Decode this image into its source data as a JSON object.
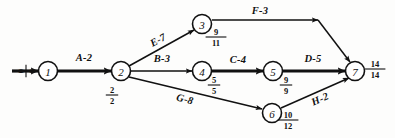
{
  "diagram": {
    "type": "activity-on-arrow-network",
    "ink_color": "#111111",
    "background_color": "#fdfdfc",
    "nodes": [
      {
        "id": "1",
        "label": "1",
        "cx": 48,
        "cy": 71,
        "r": 9.5,
        "time_numerator": "0",
        "time_denominator": "0",
        "time_x": 26,
        "time_y": 71,
        "rotated": true
      },
      {
        "id": "2",
        "label": "2",
        "cx": 121,
        "cy": 71,
        "r": 9.5,
        "time_numerator": "2",
        "time_denominator": "2",
        "time_x": 112,
        "time_y": 95,
        "rotated": false
      },
      {
        "id": "3",
        "label": "3",
        "cx": 202,
        "cy": 24,
        "r": 9.5,
        "time_numerator": "9",
        "time_denominator": "11",
        "time_x": 216,
        "time_y": 37,
        "rotated": false
      },
      {
        "id": "4",
        "label": "4",
        "cx": 202,
        "cy": 71,
        "r": 9.5,
        "time_numerator": "5",
        "time_denominator": "5",
        "time_x": 214,
        "time_y": 85,
        "rotated": false
      },
      {
        "id": "5",
        "label": "5",
        "cx": 273,
        "cy": 71,
        "r": 9.5,
        "time_numerator": "9",
        "time_denominator": "9",
        "time_x": 286,
        "time_y": 85,
        "rotated": false
      },
      {
        "id": "6",
        "label": "6",
        "cx": 272,
        "cy": 113,
        "r": 9.5,
        "time_numerator": "10",
        "time_denominator": "12",
        "time_x": 288,
        "time_y": 120,
        "rotated": false
      },
      {
        "id": "7",
        "label": "7",
        "cx": 355,
        "cy": 71,
        "r": 9.5,
        "time_numerator": "14",
        "time_denominator": "14",
        "time_x": 375,
        "time_y": 69,
        "rotated": false
      }
    ],
    "entry_arrow": {
      "from_x": 12,
      "from_y": 71,
      "to_x": 38,
      "to_y": 71
    },
    "edges": [
      {
        "id": "A",
        "activity": "A",
        "duration": "2",
        "label": "A-2",
        "from": "1",
        "to": "2",
        "weight": "thick",
        "x1": 58,
        "y1": 71,
        "x2": 111,
        "y2": 71,
        "label_x": 84,
        "label_y": 57,
        "label_rotate": 0
      },
      {
        "id": "E",
        "activity": "E",
        "duration": "7",
        "label": "E-7",
        "from": "2",
        "to": "3",
        "weight": "thin",
        "x1": 129,
        "y1": 66,
        "x2": 194,
        "y2": 30,
        "label_x": 158,
        "label_y": 40,
        "label_rotate": -29
      },
      {
        "id": "B",
        "activity": "B",
        "duration": "3",
        "label": "B-3",
        "from": "2",
        "to": "4",
        "weight": "thin",
        "x1": 131,
        "y1": 71,
        "x2": 192,
        "y2": 71,
        "label_x": 162,
        "label_y": 58,
        "label_rotate": 0
      },
      {
        "id": "G",
        "activity": "G",
        "duration": "8",
        "label": "G-8",
        "from": "2",
        "to": "6",
        "weight": "thin",
        "x1": 129,
        "y1": 77,
        "x2": 262,
        "y2": 109,
        "label_x": 185,
        "label_y": 99,
        "label_rotate": 14
      },
      {
        "id": "F",
        "activity": "F",
        "duration": "3",
        "label": "F-3",
        "from": "3",
        "to": "7",
        "weight": "thin",
        "x1": 212,
        "y1": 20,
        "x2": 318,
        "y2": 20,
        "label_x": 260,
        "label_y": 10,
        "label_rotate": 0
      },
      {
        "id": "F2",
        "activity": "F",
        "duration": "3",
        "label": "",
        "from": "3",
        "to": "7",
        "weight": "thin",
        "x1": 318,
        "y1": 20,
        "x2": 350,
        "y2": 62,
        "label_x": 0,
        "label_y": 0,
        "label_rotate": 0
      },
      {
        "id": "C",
        "activity": "C",
        "duration": "4",
        "label": "C-4",
        "from": "4",
        "to": "5",
        "weight": "thick",
        "x1": 212,
        "y1": 71,
        "x2": 263,
        "y2": 71,
        "label_x": 238,
        "label_y": 59,
        "label_rotate": 0
      },
      {
        "id": "D",
        "activity": "D",
        "duration": "5",
        "label": "D-5",
        "from": "5",
        "to": "7",
        "weight": "thick",
        "x1": 283,
        "y1": 71,
        "x2": 345,
        "y2": 71,
        "label_x": 313,
        "label_y": 58,
        "label_rotate": 0
      },
      {
        "id": "H",
        "activity": "H",
        "duration": "2",
        "label": "H-2",
        "from": "6",
        "to": "7",
        "weight": "thin",
        "x1": 281,
        "y1": 108,
        "x2": 349,
        "y2": 78,
        "label_x": 320,
        "label_y": 99,
        "label_rotate": -24
      }
    ]
  }
}
